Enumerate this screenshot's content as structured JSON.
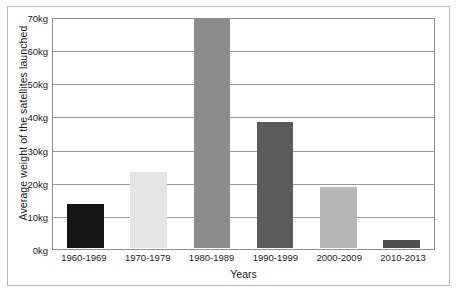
{
  "chart_data": {
    "type": "bar",
    "title": "",
    "subtitle": "",
    "xlabel": "Years",
    "ylabel": "Average weight of the satellites launched",
    "categories": [
      "1960-1969",
      "1970-1979",
      "1980-1989",
      "1990-1999",
      "2000-2009",
      "2010-2013"
    ],
    "values": [
      13.5,
      23,
      70,
      38.5,
      18.5,
      2.5
    ],
    "bar_colors": [
      "#151515",
      "#e4e4e4",
      "#8c8c8c",
      "#5b5b5b",
      "#b6b6b6",
      "#4f4f4f"
    ],
    "ylim": [
      0,
      70
    ],
    "ytick_values": [
      0,
      10,
      20,
      30,
      40,
      50,
      60,
      70
    ],
    "ytick_labels": [
      "0kg",
      "10kg",
      "20kg",
      "30kg",
      "40kg",
      "50kg",
      "60kg",
      "70kg"
    ],
    "unit": "kg",
    "grid": true,
    "legend": "none",
    "frame_color": "#b9b9b9",
    "axis_color": "#8f8f8f",
    "gridline_color": "#9a9a9a",
    "background": "#ffffff"
  }
}
